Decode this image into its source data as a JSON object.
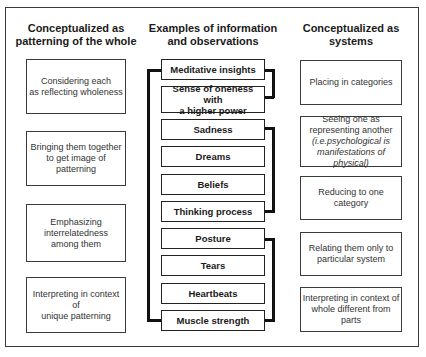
{
  "frame": {
    "border_color": "#3a3a3a"
  },
  "columns": {
    "left": {
      "title": "Conceptualized as\npatterning of the whole",
      "items": [
        {
          "text": "Considering each\nas reflecting wholeness"
        },
        {
          "text": "Bringing them together\nto get image of patterning"
        },
        {
          "text": "Emphasizing\ninterrelatedness\namong them"
        },
        {
          "text": "Interpreting in context of\nunique patterning"
        }
      ]
    },
    "middle": {
      "title": "Examples of information\nand observations",
      "items": [
        {
          "text": "Meditative insights"
        },
        {
          "text": "Sense of oneness with\na higher power"
        },
        {
          "text": "Sadness"
        },
        {
          "text": "Dreams"
        },
        {
          "text": "Beliefs"
        },
        {
          "text": "Thinking process"
        },
        {
          "text": "Posture"
        },
        {
          "text": "Tears"
        },
        {
          "text": "Heartbeats"
        },
        {
          "text": "Muscle strength"
        }
      ],
      "brackets": {
        "left": {
          "from": "Meditative insights",
          "to": "Muscle strength"
        },
        "right": [
          {
            "from": "Meditative insights",
            "to": "Sense of oneness with a higher power"
          },
          {
            "from": "Sadness",
            "to": "Thinking process"
          },
          {
            "from": "Posture",
            "to": "Muscle strength"
          }
        ]
      }
    },
    "right": {
      "title": "Conceptualized as\nsystems",
      "items": [
        {
          "text": "Placing in categories",
          "note": ""
        },
        {
          "text": "Seeing one as\nrepresenting another",
          "note": "(i.e.psychological is\nmanifestations of physical)"
        },
        {
          "text": "Reducing to one category",
          "note": ""
        },
        {
          "text": "Relating them only to\nparticular system",
          "note": ""
        },
        {
          "text": "Interpreting in context of\nwhole different from parts",
          "note": ""
        }
      ]
    }
  }
}
